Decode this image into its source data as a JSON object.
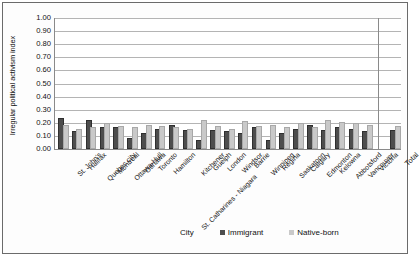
{
  "figure": {
    "y_axis_title": "Irregular political activism index",
    "x_axis_title": "City"
  },
  "legend": {
    "items": [
      {
        "label": "Immigrant",
        "color": "#4d4d4d",
        "key": "immigrant"
      },
      {
        "label": "Native-born",
        "color": "#c9c9c9",
        "key": "native"
      }
    ]
  },
  "y_ticks": [
    "1.00",
    "0.90",
    "0.80",
    "0.70",
    "0.60",
    "0.50",
    "0.40",
    "0.30",
    "0.20",
    "0.10",
    "0.00"
  ],
  "chart_data": {
    "type": "bar",
    "title": "",
    "xlabel": "City",
    "ylabel": "Irregular political activism index",
    "ylim": [
      0.0,
      1.0
    ],
    "ytick_step": 0.1,
    "grid": true,
    "legend_position": "bottom",
    "categories": [
      "St. John's",
      "Halifax",
      "Quebec city",
      "Montreal",
      "Ottawa-Hull",
      "Oshawa",
      "Toronto",
      "Hamilton",
      "St. Catharines - Niagara",
      "Kitchener",
      "Guelph",
      "London",
      "Windsor",
      "Barrie",
      "Winnipeg",
      "Regina",
      "Saskatoon",
      "Calgary",
      "Edmonton",
      "Kelowna",
      "Abbotsford",
      "Vancouver",
      "Victoria",
      "Total"
    ],
    "series": [
      {
        "name": "Immigrant",
        "color": "#4d4d4d",
        "values": [
          0.22,
          0.12,
          0.21,
          0.15,
          0.15,
          0.07,
          0.11,
          0.14,
          0.17,
          0.13,
          0.05,
          0.13,
          0.12,
          0.11,
          0.15,
          0.05,
          0.11,
          0.14,
          0.17,
          0.13,
          0.15,
          0.14,
          0.12,
          0.13
        ]
      },
      {
        "name": "Native-born",
        "color": "#c9c9c9",
        "values": [
          0.17,
          0.14,
          0.15,
          0.18,
          0.16,
          0.15,
          0.17,
          0.16,
          0.15,
          0.14,
          0.21,
          0.16,
          0.14,
          0.2,
          0.16,
          0.17,
          0.15,
          0.18,
          0.15,
          0.21,
          0.19,
          0.18,
          0.17,
          0.16
        ]
      }
    ],
    "dropped_tick_labels": [
      "St. Catharines - Niagara"
    ],
    "separated_group": "Total"
  }
}
